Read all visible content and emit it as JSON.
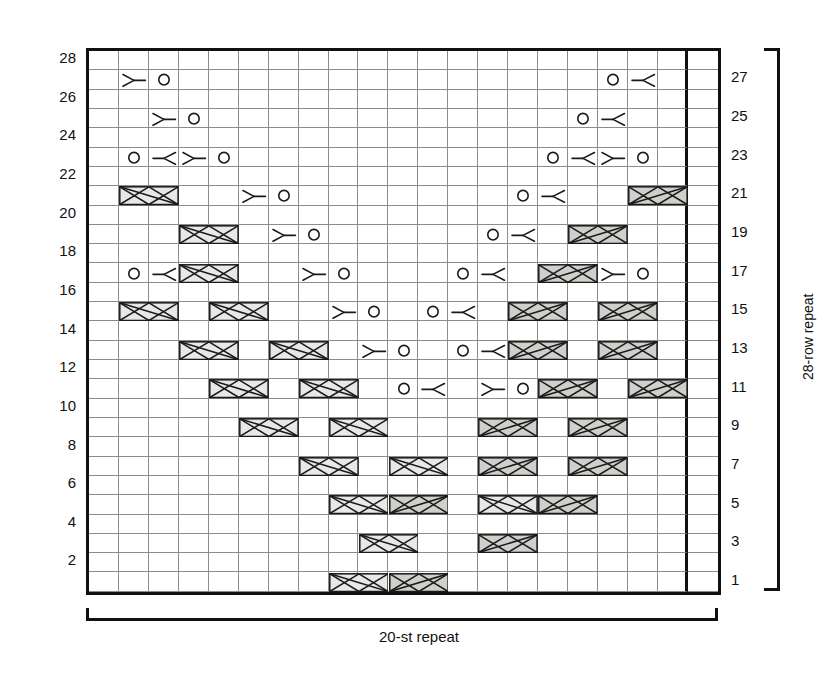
{
  "chart_data": {
    "type": "table",
    "columns": 21,
    "rows": 28,
    "stitch_repeat": 20,
    "row_repeat": 28,
    "legend": {
      "yo": "yarn over",
      "rdec": "right-leaning decrease",
      "ldec": "left-leaning decrease",
      "cable_left": "left-crossing cable (light shading, 2 sts)",
      "cable_right": "right-crossing cable (dark shading, 2 sts)"
    },
    "symbols": [
      {
        "row": 27,
        "items": [
          {
            "col": 2,
            "type": "rdec"
          },
          {
            "col": 3,
            "type": "yo"
          },
          {
            "col": 18,
            "type": "yo"
          },
          {
            "col": 19,
            "type": "ldec"
          }
        ]
      },
      {
        "row": 25,
        "items": [
          {
            "col": 3,
            "type": "rdec"
          },
          {
            "col": 4,
            "type": "yo"
          },
          {
            "col": 17,
            "type": "yo"
          },
          {
            "col": 18,
            "type": "ldec"
          }
        ]
      },
      {
        "row": 23,
        "items": [
          {
            "col": 2,
            "type": "yo"
          },
          {
            "col": 3,
            "type": "ldec"
          },
          {
            "col": 4,
            "type": "rdec"
          },
          {
            "col": 5,
            "type": "yo"
          },
          {
            "col": 16,
            "type": "yo"
          },
          {
            "col": 17,
            "type": "ldec"
          },
          {
            "col": 18,
            "type": "rdec"
          },
          {
            "col": 19,
            "type": "yo"
          }
        ]
      },
      {
        "row": 21,
        "items": [
          {
            "col": 2,
            "type": "cable_left"
          },
          {
            "col": 6,
            "type": "rdec"
          },
          {
            "col": 7,
            "type": "yo"
          },
          {
            "col": 15,
            "type": "yo"
          },
          {
            "col": 16,
            "type": "ldec"
          },
          {
            "col": 19,
            "type": "cable_right"
          }
        ]
      },
      {
        "row": 19,
        "items": [
          {
            "col": 4,
            "type": "cable_left"
          },
          {
            "col": 7,
            "type": "rdec"
          },
          {
            "col": 8,
            "type": "yo"
          },
          {
            "col": 14,
            "type": "yo"
          },
          {
            "col": 15,
            "type": "ldec"
          },
          {
            "col": 17,
            "type": "cable_right"
          }
        ]
      },
      {
        "row": 17,
        "items": [
          {
            "col": 2,
            "type": "yo"
          },
          {
            "col": 3,
            "type": "ldec"
          },
          {
            "col": 4,
            "type": "cable_left"
          },
          {
            "col": 8,
            "type": "rdec"
          },
          {
            "col": 9,
            "type": "yo"
          },
          {
            "col": 13,
            "type": "yo"
          },
          {
            "col": 14,
            "type": "ldec"
          },
          {
            "col": 16,
            "type": "cable_right"
          },
          {
            "col": 18,
            "type": "rdec"
          },
          {
            "col": 19,
            "type": "yo"
          }
        ]
      },
      {
        "row": 15,
        "items": [
          {
            "col": 2,
            "type": "cable_left"
          },
          {
            "col": 5,
            "type": "cable_left"
          },
          {
            "col": 9,
            "type": "rdec"
          },
          {
            "col": 10,
            "type": "yo"
          },
          {
            "col": 12,
            "type": "yo"
          },
          {
            "col": 13,
            "type": "ldec"
          },
          {
            "col": 15,
            "type": "cable_right"
          },
          {
            "col": 18,
            "type": "cable_right"
          }
        ]
      },
      {
        "row": 13,
        "items": [
          {
            "col": 4,
            "type": "cable_left"
          },
          {
            "col": 7,
            "type": "cable_left"
          },
          {
            "col": 10,
            "type": "rdec"
          },
          {
            "col": 11,
            "type": "yo"
          },
          {
            "col": 13,
            "type": "yo"
          },
          {
            "col": 14,
            "type": "ldec"
          },
          {
            "col": 15,
            "type": "cable_right"
          },
          {
            "col": 18,
            "type": "cable_right"
          }
        ]
      },
      {
        "row": 11,
        "items": [
          {
            "col": 5,
            "type": "cable_left"
          },
          {
            "col": 8,
            "type": "cable_left"
          },
          {
            "col": 11,
            "type": "yo"
          },
          {
            "col": 12,
            "type": "ldec"
          },
          {
            "col": 14,
            "type": "rdec"
          },
          {
            "col": 15,
            "type": "yo"
          },
          {
            "col": 16,
            "type": "cable_right"
          },
          {
            "col": 19,
            "type": "cable_right"
          }
        ]
      },
      {
        "row": 9,
        "items": [
          {
            "col": 6,
            "type": "cable_left"
          },
          {
            "col": 9,
            "type": "cable_left"
          },
          {
            "col": 14,
            "type": "cable_right"
          },
          {
            "col": 17,
            "type": "cable_right"
          }
        ]
      },
      {
        "row": 7,
        "items": [
          {
            "col": 8,
            "type": "cable_left"
          },
          {
            "col": 11,
            "type": "cable_left"
          },
          {
            "col": 14,
            "type": "cable_right"
          },
          {
            "col": 17,
            "type": "cable_right"
          }
        ]
      },
      {
        "row": 5,
        "items": [
          {
            "col": 9,
            "type": "cable_left"
          },
          {
            "col": 11,
            "type": "cable_right"
          },
          {
            "col": 14,
            "type": "cable_left"
          },
          {
            "col": 16,
            "type": "cable_right"
          }
        ]
      },
      {
        "row": 3,
        "items": [
          {
            "col": 10,
            "type": "cable_left"
          },
          {
            "col": 14,
            "type": "cable_right"
          }
        ]
      },
      {
        "row": 1,
        "items": [
          {
            "col": 9,
            "type": "cable_left"
          },
          {
            "col": 11,
            "type": "cable_right"
          }
        ]
      }
    ],
    "left_labels": [
      28,
      26,
      24,
      22,
      20,
      18,
      16,
      14,
      12,
      10,
      8,
      6,
      4,
      2
    ],
    "right_labels": [
      27,
      25,
      23,
      21,
      19,
      17,
      15,
      13,
      11,
      9,
      7,
      5,
      3,
      1
    ],
    "xlabel": "20-st repeat",
    "ylabel": "28-row repeat",
    "grid": true
  },
  "labels": {
    "stitch_repeat_caption": "20-st repeat",
    "row_repeat_caption": "28-row repeat"
  },
  "colors": {
    "grid_line": "#8c8c8c",
    "border": "#111111",
    "cable_left_fill": "#e8e8e6",
    "cable_right_fill": "#cfcfcc",
    "symbol_stroke": "#1a1a1a"
  }
}
